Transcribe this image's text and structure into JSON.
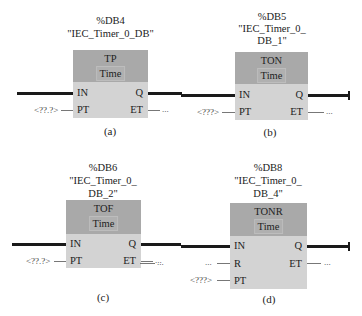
{
  "diagrams": [
    {
      "id": "a",
      "db": "%DB4",
      "instance_lines": [
        "\"IEC_Timer_0_DB\""
      ],
      "type": "TP",
      "time_label": "Time",
      "inputs": [
        "IN",
        "PT"
      ],
      "outputs": [
        "Q",
        "ET"
      ],
      "pt_value": "<??.?>",
      "et_value": "...",
      "caption": "(a)"
    },
    {
      "id": "b",
      "db": "%DB5",
      "instance_lines": [
        "\"IEC_Timer_0_",
        "DB_1\""
      ],
      "type": "TON",
      "time_label": "Time",
      "inputs": [
        "IN",
        "PT"
      ],
      "outputs": [
        "Q",
        "ET"
      ],
      "pt_value": "<???>",
      "et_value": "...",
      "caption": "(b)"
    },
    {
      "id": "c",
      "db": "%DB6",
      "instance_lines": [
        "\"IEC_Timer_0_",
        "DB_2\""
      ],
      "type": "TOF",
      "time_label": "Time",
      "inputs": [
        "IN",
        "PT"
      ],
      "outputs": [
        "Q",
        "ET"
      ],
      "pt_value": "<??.?>",
      "et_value": "...",
      "caption": "(c)"
    },
    {
      "id": "d",
      "db": "%DB8",
      "instance_lines": [
        "\"IEC_Timer_0_",
        "DB_4\""
      ],
      "type": "TONR",
      "time_label": "Time",
      "inputs": [
        "IN",
        "R",
        "PT"
      ],
      "outputs": [
        "Q",
        "ET"
      ],
      "r_value": "...",
      "pt_value": "<???>",
      "et_value": "...",
      "caption": "(d)"
    }
  ],
  "colors": {
    "header": "#a9a9a9",
    "body": "#d3d3d3",
    "wire": "#1a1a1a"
  }
}
